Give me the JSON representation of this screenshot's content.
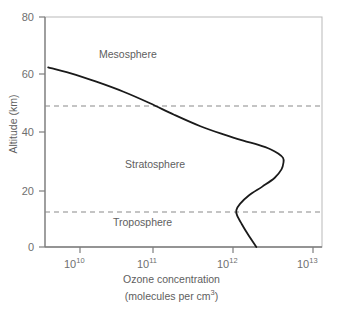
{
  "figure": {
    "name": "ozone-concentration-vs-altitude-profile"
  },
  "axes": {
    "y_title": "Altitude (km)",
    "x_title_line1": "Ozone concentration",
    "x_title_line2_pre": "(molecules per cm",
    "x_title_line2_exp": "3",
    "x_title_line2_post": ")",
    "y_ticks": [
      "0",
      "20",
      "40",
      "60",
      "80"
    ],
    "x_tick_mantissa": "10",
    "x_tick_exponents": [
      "10",
      "11",
      "12",
      "13"
    ]
  },
  "regions": [
    {
      "label": "Mesosphere"
    },
    {
      "label": "Stratosphere"
    },
    {
      "label": "Troposphere"
    }
  ],
  "colors": {
    "curve": "#1a1a1a",
    "axis": "#8a8a8a",
    "dashed": "#8a8a8a",
    "text": "#5e5e5e",
    "background": "#ffffff"
  },
  "chart_data": {
    "type": "line",
    "title": "",
    "xlabel": "Ozone concentration (molecules per cm^3)",
    "ylabel": "Altitude (km)",
    "xscale": "log",
    "xlim": [
      4000000000.0,
      20000000000000.0
    ],
    "ylim": [
      0,
      80
    ],
    "xticks": [
      10000000000.0,
      100000000000.0,
      1000000000000.0,
      10000000000000.0
    ],
    "xticklabels": [
      "10^10",
      "10^11",
      "10^12",
      "10^13"
    ],
    "yticks": [
      0,
      20,
      40,
      60,
      80
    ],
    "yticklabels": [
      "0",
      "20",
      "40",
      "60",
      "80"
    ],
    "grid": false,
    "legend": null,
    "series": [
      {
        "name": "Ozone concentration profile",
        "x": [
          4000000000.0,
          7500000000.0,
          16000000000.0,
          35000000000.0,
          75000000000.0,
          150000000000.0,
          320000000000.0,
          650000000000.0,
          1100000000000.0,
          1700000000000.0,
          2400000000000.0,
          3000000000000.0,
          3450000000000.0,
          3500000000000.0,
          3300000000000.0,
          2700000000000.0,
          1900000000000.0,
          1300000000000.0,
          1000000000000.0,
          900000000000.0,
          920000000000.0,
          1050000000000.0,
          1250000000000.0,
          1600000000000.0
        ],
        "y": [
          62.5,
          60.5,
          57.5,
          54.0,
          50.0,
          46.0,
          42.0,
          39.0,
          37.0,
          35.5,
          34.0,
          32.5,
          31.0,
          29.5,
          27.0,
          24.0,
          21.0,
          18.0,
          15.0,
          12.8,
          11.0,
          8.0,
          4.5,
          0.0
        ],
        "units": "molecules per cm^3 vs km"
      }
    ],
    "hlines": [
      {
        "y": 50,
        "label": "stratopause",
        "style": "dashed"
      },
      {
        "y": 12.5,
        "label": "tropopause",
        "style": "dashed"
      }
    ],
    "annotations": [
      {
        "text": "Mesosphere",
        "x": 30000000000.0,
        "y": 68.5
      },
      {
        "text": "Stratosphere",
        "x": 70000000000.0,
        "y": 32.0
      },
      {
        "text": "Troposphere",
        "x": 60000000000.0,
        "y": 8.0
      }
    ]
  }
}
